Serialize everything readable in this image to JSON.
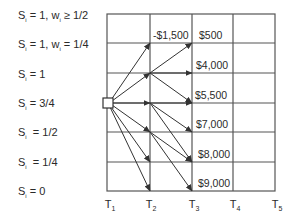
{
  "state_labels": [
    {
      "var": "S",
      "sub": "i",
      "text": " = 1, w",
      "sub2": "i",
      "tail": " ≥ 1/2"
    },
    {
      "var": "S",
      "sub": "i",
      "text": " = 1, w",
      "sub2": "i",
      "tail": " = 1/4"
    },
    {
      "var": "S",
      "sub": "i",
      "text": " = 1",
      "sub2": "",
      "tail": ""
    },
    {
      "var": "S",
      "sub": "i",
      "text": " = 3/4",
      "sub2": "",
      "tail": ""
    },
    {
      "var": "S",
      "sub": "i",
      "text": "  = 1/2",
      "sub2": "",
      "tail": ""
    },
    {
      "var": "S",
      "sub": "i",
      "text": "  = 1/4",
      "sub2": "",
      "tail": ""
    },
    {
      "var": "S",
      "sub": "i",
      "text": " = 0",
      "sub2": "",
      "tail": ""
    }
  ],
  "time_labels": [
    {
      "var": "T",
      "sub": "1"
    },
    {
      "var": "T",
      "sub": "2"
    },
    {
      "var": "T",
      "sub": "3"
    },
    {
      "var": "T",
      "sub": "4"
    },
    {
      "var": "T",
      "sub": "5"
    }
  ],
  "values": {
    "t2_top": "-$1,500",
    "t3": [
      "$500",
      "$4,000",
      "$5,500",
      "$7,000",
      "$8,000",
      "$9,000"
    ]
  },
  "colors": {
    "line": "#333333",
    "grid": "#555555"
  }
}
